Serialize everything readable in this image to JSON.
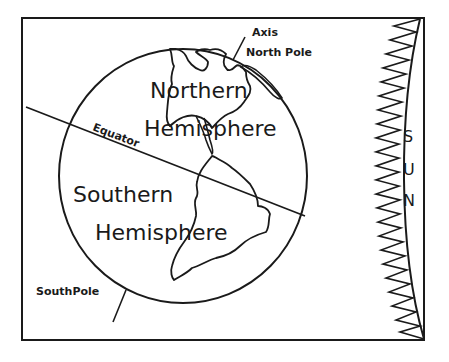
{
  "diagram": {
    "labels": {
      "axis": "Axis",
      "north_pole": "North Pole",
      "south_pole": "SouthPole",
      "equator": "Equator",
      "northern_1": "Northern",
      "northern_2": "Hemisphere",
      "southern_1": "Southern",
      "southern_2": "Hemisphere",
      "sun": [
        "S",
        "U",
        "N"
      ]
    },
    "colors": {
      "ink": "#1a1a1a",
      "background": "#ffffff"
    }
  }
}
